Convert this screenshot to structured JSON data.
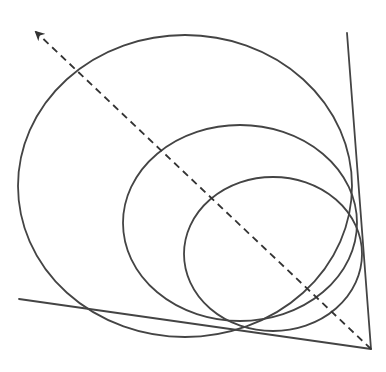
{
  "diagram": {
    "width": 386,
    "height": 372,
    "background": "#ffffff",
    "stroke_color": "#444444",
    "stroke_width": 1.8,
    "angle": {
      "vertex": [
        371,
        349
      ],
      "ray_right_end": [
        347,
        33
      ],
      "ray_bottom_end": [
        19,
        299
      ]
    },
    "circles": [
      {
        "name": "large",
        "cx": 185,
        "cy": 186,
        "rx": 167,
        "ry": 151
      },
      {
        "name": "medium",
        "cx": 240,
        "cy": 223,
        "rx": 117,
        "ry": 98
      },
      {
        "name": "small",
        "cx": 273,
        "cy": 254,
        "rx": 89,
        "ry": 77
      }
    ],
    "bisector": {
      "style": "dashed",
      "from": [
        371,
        349
      ],
      "to": [
        36,
        32
      ],
      "arrowhead": "at-end"
    }
  }
}
